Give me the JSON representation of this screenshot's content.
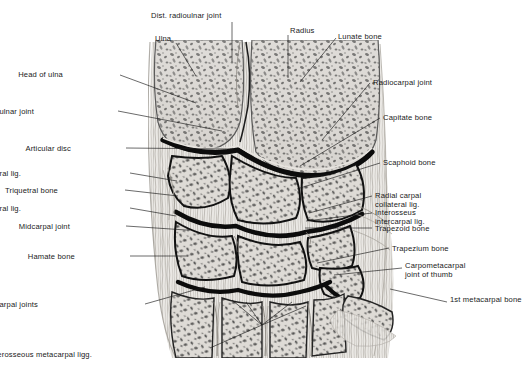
{
  "figure": {
    "background": "#ffffff",
    "ink": "#1a1a1a",
    "width": 522,
    "height": 378
  },
  "labels": [
    {
      "id": "dist-radioulnar-joint-top",
      "text": "Dist. radioulnar joint",
      "side": "top",
      "x": 151,
      "y": 11,
      "leader": [
        [
          232,
          22
        ],
        [
          232,
          62
        ]
      ]
    },
    {
      "id": "ulna",
      "text": "Ulna",
      "side": "top",
      "x": 155,
      "y": 34,
      "leader": [
        [
          176,
          43
        ],
        [
          196,
          76
        ]
      ]
    },
    {
      "id": "radius",
      "text": "Radius",
      "side": "top",
      "x": 290,
      "y": 26,
      "leader": [
        [
          288,
          35
        ],
        [
          288,
          78
        ]
      ]
    },
    {
      "id": "lunate-bone",
      "text": "Lunate bone",
      "side": "right",
      "x": 338,
      "y": 32,
      "leader": [
        [
          336,
          38
        ],
        [
          300,
          82
        ]
      ]
    },
    {
      "id": "head-of-ulna",
      "text": "Head of ulna",
      "side": "left",
      "x": 63,
      "y": 70,
      "leader": [
        [
          120,
          75
        ],
        [
          196,
          103
        ]
      ]
    },
    {
      "id": "radiocarpal-joint",
      "text": "Radiocarpal joint",
      "side": "right",
      "x": 373,
      "y": 78,
      "leader": [
        [
          370,
          83
        ],
        [
          322,
          140
        ]
      ]
    },
    {
      "id": "dist-radioulnar-joint-mid",
      "text": "Dist. radioulnar joint",
      "side": "left",
      "x": 34,
      "y": 107,
      "leader": [
        [
          118,
          111
        ],
        [
          222,
          131
        ]
      ]
    },
    {
      "id": "capitate-bone",
      "text": "Capitate bone",
      "side": "right",
      "x": 383,
      "y": 113,
      "leader": [
        [
          380,
          118
        ],
        [
          300,
          166
        ]
      ]
    },
    {
      "id": "articular-disc",
      "text": "Articular disc",
      "side": "left",
      "x": 71,
      "y": 144,
      "leader": [
        [
          126,
          148
        ],
        [
          233,
          149
        ]
      ]
    },
    {
      "id": "scaphoid-bone",
      "text": "Scaphoid bone",
      "side": "right",
      "x": 383,
      "y": 158,
      "leader": [
        [
          380,
          163
        ],
        [
          297,
          189
        ]
      ]
    },
    {
      "id": "ulnar-carpal-collateral-lig-1",
      "text": "Ulnar carpal collateral lig.",
      "side": "left",
      "x": 21,
      "y": 169,
      "leader": [
        [
          130,
          173
        ],
        [
          177,
          181
        ]
      ]
    },
    {
      "id": "triquetral-bone",
      "text": "Triquetral bone",
      "side": "left",
      "x": 58,
      "y": 186,
      "leader": [
        [
          125,
          190
        ],
        [
          178,
          196
        ]
      ]
    },
    {
      "id": "radial-carpal-collateral-lig",
      "text": "Radial carpal collateral lig.",
      "side": "right",
      "x": 375,
      "y": 191,
      "leader": [
        [
          372,
          196
        ],
        [
          309,
          213
        ]
      ]
    },
    {
      "id": "ulnar-carpal-collateral-lig-2",
      "text": "Ulnar carpal collateral lig.",
      "side": "left",
      "x": 21,
      "y": 204,
      "leader": [
        [
          130,
          208
        ],
        [
          176,
          216
        ]
      ]
    },
    {
      "id": "interosseus-intercarpal-lig",
      "text": "Interosseus intercarpal lig.",
      "side": "right",
      "x": 375,
      "y": 208,
      "leader": [
        [
          372,
          213
        ],
        [
          306,
          221
        ]
      ]
    },
    {
      "id": "trapezoid-bone",
      "text": "Trapezoid bone",
      "side": "right",
      "x": 375,
      "y": 224,
      "leader": [
        [
          372,
          228
        ],
        [
          305,
          228
        ]
      ]
    },
    {
      "id": "midcarpal-joint",
      "text": "Midcarpal joint",
      "side": "left",
      "x": 70,
      "y": 222,
      "leader": [
        [
          126,
          226
        ],
        [
          186,
          230
        ]
      ]
    },
    {
      "id": "trapezium-bone",
      "text": "Trapezium bone",
      "side": "right",
      "x": 392,
      "y": 244,
      "leader": [
        [
          389,
          248
        ],
        [
          317,
          263
        ]
      ]
    },
    {
      "id": "hamate-bone",
      "text": "Hamate bone",
      "side": "left",
      "x": 75,
      "y": 252,
      "leader": [
        [
          130,
          256
        ],
        [
          188,
          256
        ]
      ]
    },
    {
      "id": "carpometacarpal-joint-of-thumb",
      "text": "Carpometacarpal joint of thumb",
      "side": "right",
      "x": 405,
      "y": 261,
      "leader": [
        [
          402,
          268
        ],
        [
          334,
          275
        ]
      ]
    },
    {
      "id": "carpometacarpal-joints",
      "text": "Carpometacarpal joints",
      "side": "left",
      "x": 38,
      "y": 300,
      "leader": [
        [
          145,
          304
        ],
        [
          205,
          287
        ]
      ]
    },
    {
      "id": "first-metacarpal-bone",
      "text": "1st metacarpal bone",
      "side": "right",
      "x": 450,
      "y": 295,
      "leader": [
        [
          447,
          302
        ],
        [
          390,
          289
        ]
      ]
    },
    {
      "id": "interosseous-metacarpal-ligg",
      "text": "Interosseous metacarpal ligg.",
      "side": "bottom",
      "x": 92,
      "y": 350,
      "leader": [
        [
          210,
          348
        ],
        [
          262,
          325
        ]
      ]
    }
  ],
  "extra_leaders": [
    [
      [
        262,
        325
      ],
      [
        232,
        300
      ]
    ],
    [
      [
        262,
        325
      ],
      [
        246,
        302
      ]
    ],
    [
      [
        262,
        325
      ],
      [
        292,
        302
      ]
    ],
    [
      [
        262,
        325
      ],
      [
        306,
        306
      ]
    ]
  ]
}
